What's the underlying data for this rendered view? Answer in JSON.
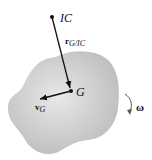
{
  "diagram": {
    "type": "rigid-body-kinematics",
    "body": {
      "fill": "#c9c9c9",
      "highlight": "#e6e6e6"
    },
    "points": {
      "ic": {
        "label": "IC",
        "x": 52,
        "y": 17
      },
      "g": {
        "label": "G",
        "x": 71,
        "y": 91
      }
    },
    "vectors": {
      "r": {
        "symbol": "r",
        "subscript": "G/IC"
      },
      "v": {
        "symbol": "v",
        "subscript": "G"
      }
    },
    "rotation": {
      "symbol": "ω",
      "direction": "clockwise"
    },
    "colors": {
      "ink": "#111111"
    }
  }
}
